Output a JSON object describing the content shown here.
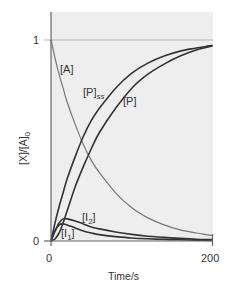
{
  "chart_data": {
    "type": "line",
    "title": "",
    "xlabel": "Time/s",
    "ylabel": "[X]/[A]0",
    "xlim": [
      0,
      200
    ],
    "ylim": [
      0,
      1
    ],
    "x_ticks": [
      "0",
      "200"
    ],
    "y_ticks": [
      "0",
      "1"
    ],
    "grid": false,
    "reference_line": {
      "y": 1,
      "color": "#b0b0b0"
    },
    "background": "#eeeeee",
    "x": [
      0,
      5,
      10,
      15,
      20,
      30,
      40,
      50,
      60,
      80,
      100,
      120,
      140,
      160,
      180,
      200
    ],
    "series": [
      {
        "name": "[A]",
        "color": "#777777",
        "values": [
          1.0,
          0.91,
          0.83,
          0.76,
          0.69,
          0.58,
          0.48,
          0.4,
          0.34,
          0.24,
          0.165,
          0.115,
          0.08,
          0.055,
          0.04,
          0.027
        ]
      },
      {
        "name": "[P]ss",
        "color": "#333333",
        "values": [
          0.0,
          0.09,
          0.17,
          0.24,
          0.31,
          0.42,
          0.52,
          0.6,
          0.66,
          0.76,
          0.835,
          0.885,
          0.92,
          0.945,
          0.96,
          0.973
        ]
      },
      {
        "name": "[P]",
        "color": "#333333",
        "values": [
          0.0,
          0.01,
          0.04,
          0.09,
          0.15,
          0.27,
          0.37,
          0.46,
          0.54,
          0.66,
          0.76,
          0.83,
          0.88,
          0.92,
          0.95,
          0.97
        ]
      },
      {
        "name": "[I2]",
        "color": "#333333",
        "values": [
          0.0,
          0.05,
          0.09,
          0.11,
          0.11,
          0.1,
          0.085,
          0.07,
          0.06,
          0.045,
          0.033,
          0.024,
          0.018,
          0.013,
          0.009,
          0.007
        ]
      },
      {
        "name": "[I1]",
        "color": "#333333",
        "values": [
          0.0,
          0.05,
          0.08,
          0.085,
          0.08,
          0.065,
          0.05,
          0.04,
          0.032,
          0.022,
          0.015,
          0.011,
          0.008,
          0.006,
          0.004,
          0.003
        ]
      }
    ],
    "annotations": [
      {
        "text": "[A]",
        "x": 18,
        "y": 0.87
      },
      {
        "text": "[P]",
        "sub": "ss",
        "x": 35,
        "y": 0.75
      },
      {
        "text": "[P]",
        "x": 90,
        "y": 0.65
      },
      {
        "text": "[I]",
        "sub": "2",
        "x": 40,
        "y": 0.2
      },
      {
        "text": "[I]",
        "sub": "1",
        "x": 18,
        "y": 0.06
      }
    ]
  },
  "labels": {
    "xlabel": "Time/s",
    "ylabel_main": "[X]/[A]",
    "ylabel_sub": "0",
    "x_tick_0": "0",
    "x_tick_200": "200",
    "y_tick_0": "0",
    "y_tick_1": "1",
    "series_A": "[A]",
    "series_Pss": "[P]",
    "series_Pss_sub": "ss",
    "series_P": "[P]",
    "series_I2": "[I",
    "series_I2_sub": "2",
    "series_I1": "[I",
    "series_I1_sub": "1"
  }
}
